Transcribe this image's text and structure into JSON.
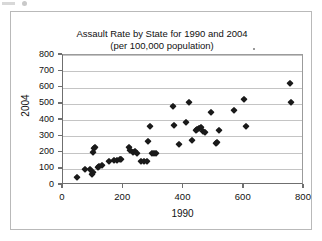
{
  "figure": {
    "title": "Assault Rate by State for 1990 and 2004",
    "subtitle": "(per 100,000 population)"
  },
  "chart_data": {
    "type": "scatter",
    "title": "Assault Rate by State for 1990 and 2004",
    "subtitle": "(per 100,000 population)",
    "xlabel": "1990",
    "ylabel": "2004",
    "xlim": [
      0,
      800
    ],
    "ylim": [
      0,
      800
    ],
    "xticks": [
      0,
      200,
      400,
      600,
      800
    ],
    "yticks": [
      0,
      100,
      200,
      300,
      400,
      500,
      600,
      700,
      800
    ],
    "grid": "horizontal",
    "legend": "none",
    "marker": "filled-diamond",
    "marker_color": "#1a1a1a",
    "points": [
      [
        47,
        50
      ],
      [
        72,
        97
      ],
      [
        88,
        100
      ],
      [
        97,
        68
      ],
      [
        100,
        78
      ],
      [
        100,
        205
      ],
      [
        103,
        228
      ],
      [
        105,
        232
      ],
      [
        115,
        112
      ],
      [
        120,
        118
      ],
      [
        128,
        124
      ],
      [
        152,
        148
      ],
      [
        168,
        152
      ],
      [
        178,
        155
      ],
      [
        188,
        160
      ],
      [
        193,
        163
      ],
      [
        218,
        233
      ],
      [
        222,
        214
      ],
      [
        232,
        205
      ],
      [
        240,
        207
      ],
      [
        247,
        198
      ],
      [
        258,
        148
      ],
      [
        268,
        145
      ],
      [
        278,
        150
      ],
      [
        283,
        272
      ],
      [
        288,
        363
      ],
      [
        297,
        196
      ],
      [
        303,
        200
      ],
      [
        310,
        197
      ],
      [
        365,
        487
      ],
      [
        368,
        372
      ],
      [
        385,
        253
      ],
      [
        408,
        388
      ],
      [
        418,
        513
      ],
      [
        428,
        280
      ],
      [
        440,
        340
      ],
      [
        445,
        345
      ],
      [
        452,
        348
      ],
      [
        458,
        360
      ],
      [
        465,
        333
      ],
      [
        472,
        325
      ],
      [
        492,
        447
      ],
      [
        508,
        258
      ],
      [
        512,
        265
      ],
      [
        518,
        340
      ],
      [
        568,
        462
      ],
      [
        602,
        527
      ],
      [
        608,
        362
      ],
      [
        752,
        625
      ],
      [
        757,
        510
      ]
    ]
  },
  "axes": {
    "y_title": "2004",
    "x_title": "1990",
    "y_labels": [
      "800",
      "700",
      "600",
      "500",
      "400",
      "300",
      "200",
      "100",
      "0"
    ],
    "x_labels": [
      "0",
      "200",
      "400",
      "600",
      "800"
    ]
  }
}
